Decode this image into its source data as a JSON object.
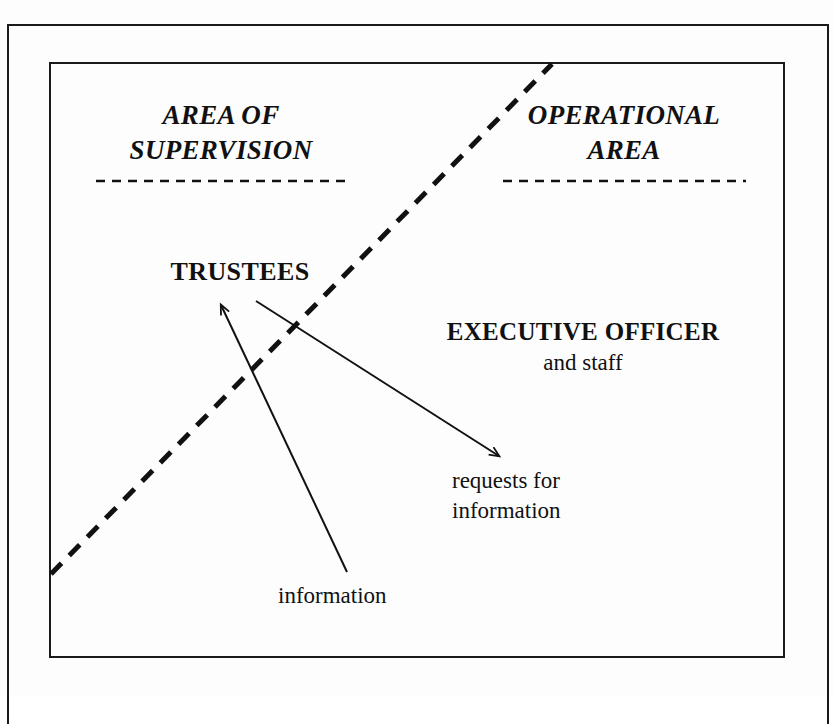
{
  "diagram": {
    "headings": {
      "left": "AREA OF\nSUPERVISION",
      "right": "OPERATIONAL\nAREA"
    },
    "nodes": {
      "trustees": "TRUSTEES",
      "executive_officer_title": "EXECUTIVE OFFICER",
      "executive_officer_subtitle": "and staff"
    },
    "arrow_labels": {
      "requests": "requests for\ninformation",
      "information": "information"
    },
    "colors": {
      "ink": "#111111",
      "frame": "#1a1a1a",
      "background": "#fdfdfd"
    }
  }
}
